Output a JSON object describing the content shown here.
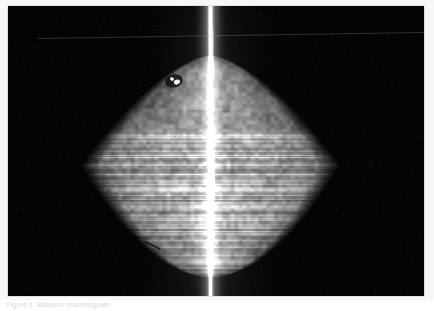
{
  "document": {
    "type": "medical-radiograph-figure",
    "background_color": "#ffffff",
    "page_tint": "#f7f7f5"
  },
  "figure": {
    "name": "bilateral-mammogram",
    "modality": "Mammography",
    "view": "Bilateral cleavage / cleavage view (CV)",
    "frame": {
      "x": 8,
      "y": 6,
      "width": 416,
      "height": 290,
      "background_color": "#000000",
      "border_color": "#e2e2e0"
    }
  },
  "imaging": {
    "colors": {
      "background": "#000000",
      "tissue_mid": "#8d8d8d",
      "tissue_bright": "#d8d8d8",
      "tissue_dim": "#4a4a4a",
      "midline_bright": "#ffffff",
      "marker_clip": "#ffffff",
      "skin_edge": "#6a6a6a"
    },
    "midline": {
      "name": "sternal-midline",
      "center_x": 210,
      "label": "Bright vertical midline band"
    },
    "marker": {
      "name": "radiopaque-marker-clip",
      "x": 168,
      "y": 76,
      "width": 14,
      "height": 11,
      "label": "Metallic marker clip, upper left breast"
    },
    "artifacts": [
      {
        "name": "scan-line-artifact",
        "orientation": "horizontal",
        "y": 26
      }
    ],
    "tissue_mass": {
      "name": "breast-tissue-mass",
      "shape": "heart",
      "center_x": 210,
      "center_y": 165,
      "half_width": 130,
      "half_height": 100,
      "density": "Heterogeneously dense fibroglandular tissue"
    }
  },
  "caption": {
    "name": "figure-caption",
    "text": "Figure 1.  Bilateral mammogram",
    "truncated": true,
    "color": "#b9b9b9"
  }
}
